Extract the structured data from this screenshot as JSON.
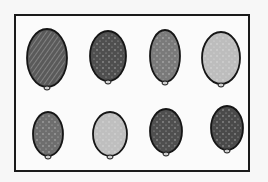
{
  "image": {
    "description": "Hand-drawn sketch of eight egg-shaped specimens arranged in two rows inside a rectangular frame",
    "rows": 2,
    "columns": 4
  },
  "specimens": [
    {
      "row": 1,
      "col": 1,
      "cx": 47,
      "cy": 58,
      "rx": 20,
      "ry": 29,
      "fill": "#5a5a5a",
      "texture": "dense-hatched"
    },
    {
      "row": 1,
      "col": 2,
      "cx": 108,
      "cy": 56,
      "rx": 18,
      "ry": 25,
      "fill": "#4f4f4f",
      "texture": "dark-scribble"
    },
    {
      "row": 1,
      "col": 3,
      "cx": 165,
      "cy": 56,
      "rx": 15,
      "ry": 26,
      "fill": "#7a7a7a",
      "texture": "speckled"
    },
    {
      "row": 1,
      "col": 4,
      "cx": 221,
      "cy": 58,
      "rx": 19,
      "ry": 26,
      "fill": "#bdbdbd",
      "texture": "light"
    },
    {
      "row": 2,
      "col": 1,
      "cx": 48,
      "cy": 134,
      "rx": 15,
      "ry": 22,
      "fill": "#6e6e6e",
      "texture": "speckled"
    },
    {
      "row": 2,
      "col": 2,
      "cx": 110,
      "cy": 134,
      "rx": 17,
      "ry": 22,
      "fill": "#bfbfbf",
      "texture": "light"
    },
    {
      "row": 2,
      "col": 3,
      "cx": 166,
      "cy": 131,
      "rx": 16,
      "ry": 22,
      "fill": "#4f4f4f",
      "texture": "speckled-dark"
    },
    {
      "row": 2,
      "col": 4,
      "cx": 227,
      "cy": 128,
      "rx": 16,
      "ry": 22,
      "fill": "#4a4a4a",
      "texture": "dark"
    }
  ]
}
